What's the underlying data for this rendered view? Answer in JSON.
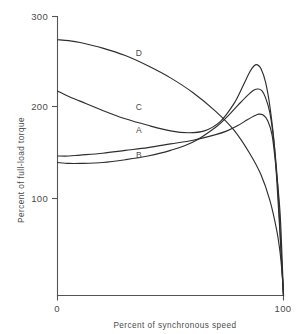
{
  "chart_data": {
    "type": "line",
    "title": "",
    "xlabel": "Percent of synchronous speed",
    "ylabel": "Percent of full-load torque",
    "xlim": [
      0,
      100
    ],
    "ylim": [
      0,
      300
    ],
    "xticks": [
      0,
      100
    ],
    "xtick_labels": [
      "0",
      "100"
    ],
    "yticks": [
      100,
      200,
      300
    ],
    "ytick_labels": [
      "100",
      "200",
      "300"
    ],
    "grid": false,
    "legend": "inline-curve-labels",
    "annotations": [
      {
        "label": "D",
        "x": 36,
        "y": 258
      },
      {
        "label": "C",
        "x": 36,
        "y": 200
      },
      {
        "label": "A",
        "x": 36,
        "y": 175
      },
      {
        "label": "B",
        "x": 36,
        "y": 148
      }
    ],
    "series": [
      {
        "name": "A",
        "label": "A",
        "color": "#2e2e2e",
        "x": [
          0,
          5,
          10,
          20,
          30,
          40,
          50,
          60,
          70,
          75,
          80,
          84,
          87,
          89,
          91,
          93,
          95,
          97,
          98.5,
          99.5,
          100
        ],
        "y": [
          150,
          150,
          151,
          153,
          156,
          159,
          163,
          167,
          173,
          177,
          183,
          189,
          193,
          195,
          194,
          188,
          172,
          130,
          88,
          32,
          0
        ]
      },
      {
        "name": "B",
        "label": "B",
        "color": "#2e2e2e",
        "x": [
          0,
          5,
          10,
          20,
          30,
          40,
          50,
          60,
          70,
          75,
          80,
          84,
          87,
          89,
          90.5,
          92,
          94,
          96,
          97.5,
          99,
          100
        ],
        "y": [
          143,
          142,
          142,
          143,
          146,
          150,
          156,
          165,
          181,
          192,
          205,
          215,
          221,
          222,
          220,
          213,
          196,
          160,
          116,
          45,
          0
        ]
      },
      {
        "name": "C",
        "label": "C",
        "color": "#2e2e2e",
        "x": [
          0,
          5,
          10,
          20,
          30,
          40,
          50,
          58,
          65,
          72,
          78,
          82,
          85,
          87,
          88.5,
          90,
          92,
          94,
          96,
          98,
          100
        ],
        "y": [
          220,
          214,
          209,
          199,
          190,
          183,
          177,
          175,
          177,
          187,
          206,
          225,
          240,
          247,
          248,
          244,
          230,
          203,
          160,
          85,
          0
        ]
      },
      {
        "name": "D",
        "label": "D",
        "color": "#2e2e2e",
        "x": [
          0,
          5,
          10,
          20,
          30,
          40,
          50,
          60,
          70,
          78,
          85,
          90,
          94,
          97,
          98.5,
          99.5,
          100
        ],
        "y": [
          275,
          274,
          272,
          266,
          258,
          247,
          234,
          218,
          198,
          178,
          153,
          130,
          102,
          70,
          46,
          20,
          0
        ]
      }
    ]
  }
}
